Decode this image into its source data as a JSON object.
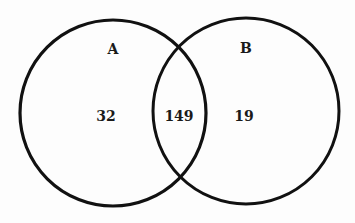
{
  "diagram": {
    "type": "venn",
    "sets": [
      {
        "name": "A",
        "only_count": "32"
      },
      {
        "name": "B",
        "only_count": "19"
      }
    ],
    "intersection_count": "149",
    "stroke_color": "#111111"
  }
}
